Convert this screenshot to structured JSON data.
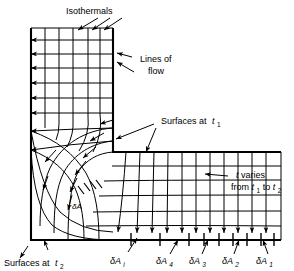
{
  "figure": {
    "type": "heat-conduction-flow-net-diagram"
  },
  "labels": {
    "isothermals": "Isothermals",
    "lines_of_flow_1": "Lines of",
    "lines_of_flow_2": "flow",
    "surfaces_at_t1": "Surfaces at",
    "surfaces_at_t1_sym": "t",
    "surfaces_at_t1_sub": "1",
    "surfaces_at_t2": "Surfaces at",
    "surfaces_at_t2_sym": "t",
    "surfaces_at_t2_sub": "2",
    "t_varies_line1_sym": "t",
    "t_varies_line1_rest": " varies",
    "t_varies_line2_a": "from ",
    "t_varies_line2_t1": "t",
    "t_varies_line2_t1sub": "1",
    "t_varies_line2_b": " to ",
    "t_varies_line2_t2": "t",
    "t_varies_line2_t2sub": "2",
    "delta_a_corner_sym": "δA",
    "area_delta": "δA",
    "area_i_sub": "i",
    "area_4_sub": "4",
    "area_3_sub": "3",
    "area_2_sub": "2",
    "area_1_sub": "1"
  },
  "area_segments": [
    {
      "id": "dAi",
      "symbol": "δA",
      "subscript": "i"
    },
    {
      "id": "dA4",
      "symbol": "δA",
      "subscript": "4"
    },
    {
      "id": "dA3",
      "symbol": "δA",
      "subscript": "3"
    },
    {
      "id": "dA2",
      "symbol": "δA",
      "subscript": "2"
    },
    {
      "id": "dA1",
      "symbol": "δA",
      "subscript": "1"
    }
  ],
  "colors": {
    "ink": "#000000",
    "background": "#ffffff",
    "line": "#1a1a1a"
  },
  "geometry": {
    "outer_left_x": 31,
    "outer_bottom_y": 240,
    "inner_right_x": 113,
    "inner_top_y": 28,
    "corner_inner_x": 113,
    "corner_inner_y": 152,
    "right_end_x": 281,
    "top_end_y": 28
  }
}
